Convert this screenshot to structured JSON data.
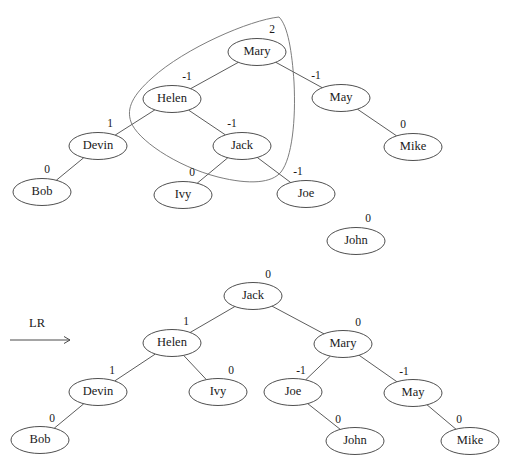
{
  "figure": {
    "type": "avl-tree-rotation-diagram",
    "operation_label": "LR",
    "node_rx": 29,
    "node_ry": 13.5
  },
  "before_tree": {
    "name": "unbalanced-avl-tree",
    "root": "Mary",
    "nodes": [
      {
        "id": "mary",
        "label": "Mary",
        "balance": "2",
        "x": 257,
        "y": 52,
        "bx": 272,
        "by": 30
      },
      {
        "id": "helen",
        "label": "Helen",
        "balance": "-1",
        "x": 172,
        "y": 99,
        "bx": 187,
        "by": 77
      },
      {
        "id": "may",
        "label": "May",
        "balance": "-1",
        "x": 341,
        "y": 98,
        "bx": 316,
        "by": 76
      },
      {
        "id": "devin",
        "label": "Devin",
        "balance": "1",
        "x": 98,
        "y": 146,
        "bx": 110,
        "by": 124
      },
      {
        "id": "jack",
        "label": "Jack",
        "balance": "-1",
        "x": 242,
        "y": 146,
        "bx": 232,
        "by": 124
      },
      {
        "id": "mike",
        "label": "Mike",
        "balance": "0",
        "x": 413,
        "y": 147,
        "bx": 403,
        "by": 125
      },
      {
        "id": "bob",
        "label": "Bob",
        "balance": "0",
        "x": 42,
        "y": 192,
        "bx": 47,
        "by": 170
      },
      {
        "id": "ivy",
        "label": "Ivy",
        "balance": "0",
        "x": 183,
        "y": 195,
        "bx": 192,
        "by": 173
      },
      {
        "id": "joe",
        "label": "Joe",
        "balance": "-1",
        "x": 306,
        "y": 194,
        "bx": 298,
        "by": 172
      },
      {
        "id": "john",
        "label": "John",
        "balance": "0",
        "x": 356,
        "y": 241,
        "bx": 368,
        "by": 219
      }
    ],
    "edges": [
      {
        "from": "mary",
        "to": "helen"
      },
      {
        "from": "mary",
        "to": "may"
      },
      {
        "from": "helen",
        "to": "devin"
      },
      {
        "from": "helen",
        "to": "jack"
      },
      {
        "from": "may",
        "to": "mike"
      },
      {
        "from": "devin",
        "to": "bob"
      },
      {
        "from": "jack",
        "to": "ivy"
      },
      {
        "from": "jack",
        "to": "joe"
      }
    ],
    "highlight_region": {
      "name": "rotation-subtree-highlight",
      "encircles": [
        "Mary",
        "Helen",
        "Jack"
      ]
    }
  },
  "after_tree": {
    "name": "rebalanced-avl-tree",
    "root": "Jack",
    "nodes": [
      {
        "id": "jack2",
        "label": "Jack",
        "balance": "0",
        "x": 253,
        "y": 296,
        "bx": 268,
        "by": 275
      },
      {
        "id": "helen2",
        "label": "Helen",
        "balance": "1",
        "x": 172,
        "y": 343,
        "bx": 186,
        "by": 322
      },
      {
        "id": "mary2",
        "label": "Mary",
        "balance": "0",
        "x": 343,
        "y": 344,
        "bx": 358,
        "by": 323
      },
      {
        "id": "devin2",
        "label": "Devin",
        "balance": "1",
        "x": 98,
        "y": 392,
        "bx": 112,
        "by": 371
      },
      {
        "id": "ivy2",
        "label": "Ivy",
        "balance": "0",
        "x": 218,
        "y": 392,
        "bx": 231,
        "by": 371
      },
      {
        "id": "joe2",
        "label": "Joe",
        "balance": "-1",
        "x": 293,
        "y": 392,
        "bx": 301,
        "by": 371
      },
      {
        "id": "may2",
        "label": "May",
        "balance": "-1",
        "x": 413,
        "y": 393,
        "bx": 404,
        "by": 372
      },
      {
        "id": "bob2",
        "label": "Bob",
        "balance": "0",
        "x": 40,
        "y": 440,
        "bx": 52,
        "by": 419
      },
      {
        "id": "john2",
        "label": "John",
        "balance": "0",
        "x": 355,
        "y": 441,
        "bx": 338,
        "by": 420
      },
      {
        "id": "mike2",
        "label": "Mike",
        "balance": "0",
        "x": 470,
        "y": 441,
        "bx": 459,
        "by": 420
      }
    ],
    "edges": [
      {
        "from": "jack2",
        "to": "helen2"
      },
      {
        "from": "jack2",
        "to": "mary2"
      },
      {
        "from": "helen2",
        "to": "devin2"
      },
      {
        "from": "helen2",
        "to": "ivy2"
      },
      {
        "from": "mary2",
        "to": "joe2"
      },
      {
        "from": "mary2",
        "to": "may2"
      },
      {
        "from": "devin2",
        "to": "bob2"
      },
      {
        "from": "joe2",
        "to": "john2"
      },
      {
        "from": "may2",
        "to": "mike2"
      }
    ]
  },
  "operation": {
    "name": "rotation-arrow",
    "label": "LR",
    "label_x": 37,
    "label_y": 324,
    "arrow_y": 340,
    "arrow_x1": 10,
    "arrow_x2": 70
  },
  "colors": {
    "stroke": "#3b3b3b",
    "edge": "#4a4a4a",
    "text": "#1a1a1a",
    "lasso": "#6e6e6e",
    "background": "#ffffff"
  }
}
